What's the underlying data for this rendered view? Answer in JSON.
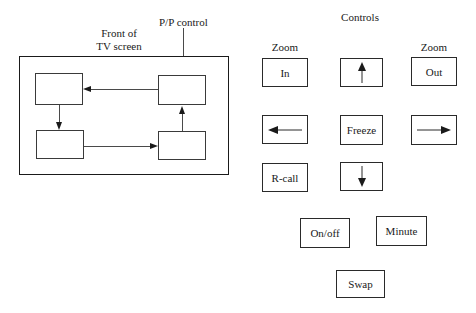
{
  "diagram": {
    "labels": {
      "front_of_tv_line1": "Front of",
      "front_of_tv_line2": "TV screen",
      "pp_control": "P/P control"
    },
    "boxes": [
      {
        "name": "tv-box-top-left",
        "label": ""
      },
      {
        "name": "tv-box-bottom-left",
        "label": ""
      },
      {
        "name": "tv-box-top-right",
        "label": ""
      },
      {
        "name": "tv-box-bottom-right",
        "label": ""
      }
    ]
  },
  "controls": {
    "title": "Controls",
    "zoom_in_caption": "Zoom",
    "zoom_out_caption": "Zoom",
    "buttons": [
      {
        "name": "zoom-in-button",
        "label": "In"
      },
      {
        "name": "up-button",
        "label": "",
        "icon": "arrow-up-icon"
      },
      {
        "name": "zoom-out-button",
        "label": "Out"
      },
      {
        "name": "left-button",
        "label": "",
        "icon": "arrow-left-icon"
      },
      {
        "name": "freeze-button",
        "label": "Freeze"
      },
      {
        "name": "right-button",
        "label": "",
        "icon": "arrow-right-icon"
      },
      {
        "name": "recall-button",
        "label": "R-call"
      },
      {
        "name": "down-button",
        "label": "",
        "icon": "arrow-down-icon"
      },
      {
        "name": "onoff-button",
        "label": "On/off"
      },
      {
        "name": "minute-button",
        "label": "Minute"
      },
      {
        "name": "swap-button",
        "label": "Swap"
      }
    ]
  },
  "colors": {
    "ink": "#1a1a1a",
    "line": "#4a4a4a",
    "background": "#ffffff"
  }
}
